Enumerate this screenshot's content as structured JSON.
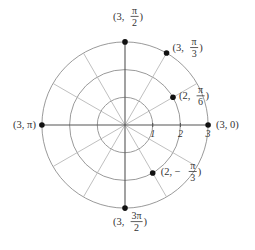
{
  "diagram": {
    "type": "polar-grid",
    "center": {
      "x": 125,
      "y": 125
    },
    "unit_px": 27.7,
    "rings": [
      1,
      2,
      3
    ],
    "spoke_angles_deg": [
      30,
      60,
      120,
      150,
      210,
      240,
      300,
      330
    ],
    "axis_ticks": [
      {
        "label": "1",
        "r": 1
      },
      {
        "label": "2",
        "r": 2
      },
      {
        "label": "3",
        "r": 3
      }
    ],
    "points": [
      {
        "id": "p-3-0",
        "r": 3,
        "theta_deg": 0,
        "label": {
          "prefix": "(3, 0)"
        }
      },
      {
        "id": "p-3-pi3",
        "r": 3,
        "theta_deg": 60,
        "label": {
          "prefix": "(3,",
          "num": "π",
          "den": "3",
          "suffix": ")"
        }
      },
      {
        "id": "p-3-pi2",
        "r": 3,
        "theta_deg": 90,
        "label": {
          "prefix": "(3,",
          "num": "π",
          "den": "2",
          "suffix": ")"
        }
      },
      {
        "id": "p-2-pi6",
        "r": 2,
        "theta_deg": 30,
        "label": {
          "prefix": "(2,",
          "num": "π",
          "den": "6",
          "suffix": ")"
        }
      },
      {
        "id": "p-3-pi",
        "r": 3,
        "theta_deg": 180,
        "label": {
          "prefix": "(3, π)"
        }
      },
      {
        "id": "p-3-3pi2",
        "r": 3,
        "theta_deg": 270,
        "label": {
          "prefix": "(3,",
          "num": "3π",
          "den": "2",
          "suffix": ")"
        }
      },
      {
        "id": "p-2-neg-pi3",
        "r": 2,
        "theta_deg": -60,
        "label": {
          "prefix": "(2, −",
          "num": "π",
          "den": "3",
          "suffix": ")"
        }
      }
    ],
    "colors": {
      "ring": "#9a9a9a",
      "spoke": "#b8b8b8",
      "axis": "#555555",
      "point": "#111111",
      "text": "#333333"
    }
  }
}
